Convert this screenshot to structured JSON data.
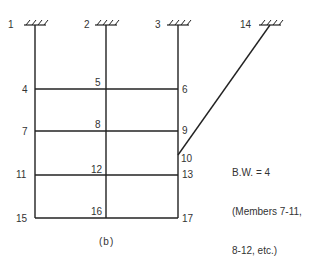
{
  "diagram": {
    "type": "frame-structure",
    "line_color": "#222222",
    "nodes": [
      {
        "id": "1",
        "label": "1",
        "x": 35,
        "y": 25,
        "support": "fixed",
        "label_x": 8,
        "label_y": 20
      },
      {
        "id": "2",
        "label": "2",
        "x": 106,
        "y": 25,
        "support": "fixed",
        "label_x": 84,
        "label_y": 20
      },
      {
        "id": "3",
        "label": "3",
        "x": 178,
        "y": 25,
        "support": "fixed",
        "label_x": 155,
        "label_y": 20
      },
      {
        "id": "4",
        "label": "4",
        "x": 35,
        "y": 89,
        "label_x": 22,
        "label_y": 85
      },
      {
        "id": "5",
        "label": "5",
        "x": 106,
        "y": 89,
        "label_x": 95,
        "label_y": 78
      },
      {
        "id": "6",
        "label": "6",
        "x": 178,
        "y": 89,
        "label_x": 182,
        "label_y": 85
      },
      {
        "id": "7",
        "label": "7",
        "x": 35,
        "y": 131,
        "label_x": 22,
        "label_y": 127
      },
      {
        "id": "8",
        "label": "8",
        "x": 106,
        "y": 131,
        "label_x": 95,
        "label_y": 120
      },
      {
        "id": "9",
        "label": "9",
        "x": 178,
        "y": 131,
        "label_x": 182,
        "label_y": 126
      },
      {
        "id": "10",
        "label": "10",
        "x": 178,
        "y": 155,
        "label_x": 181,
        "label_y": 154
      },
      {
        "id": "11",
        "label": "11",
        "x": 35,
        "y": 175,
        "label_x": 16,
        "label_y": 170
      },
      {
        "id": "12",
        "label": "12",
        "x": 106,
        "y": 175,
        "label_x": 91,
        "label_y": 165
      },
      {
        "id": "13",
        "label": "13",
        "x": 178,
        "y": 175,
        "label_x": 182,
        "label_y": 170
      },
      {
        "id": "14",
        "label": "14",
        "x": 270,
        "y": 25,
        "support": "fixed",
        "label_x": 240,
        "label_y": 20
      },
      {
        "id": "15",
        "label": "15",
        "x": 35,
        "y": 218,
        "label_x": 16,
        "label_y": 214
      },
      {
        "id": "16",
        "label": "16",
        "x": 106,
        "y": 218,
        "label_x": 91,
        "label_y": 207
      },
      {
        "id": "17",
        "label": "17",
        "x": 178,
        "y": 218,
        "label_x": 182,
        "label_y": 214
      }
    ],
    "members": [
      [
        "1",
        "4"
      ],
      [
        "4",
        "7"
      ],
      [
        "7",
        "11"
      ],
      [
        "11",
        "15"
      ],
      [
        "2",
        "5"
      ],
      [
        "5",
        "8"
      ],
      [
        "8",
        "12"
      ],
      [
        "12",
        "16"
      ],
      [
        "3",
        "6"
      ],
      [
        "6",
        "9"
      ],
      [
        "9",
        "10"
      ],
      [
        "10",
        "13"
      ],
      [
        "13",
        "17"
      ],
      [
        "4",
        "5"
      ],
      [
        "5",
        "6"
      ],
      [
        "7",
        "8"
      ],
      [
        "8",
        "9"
      ],
      [
        "11",
        "12"
      ],
      [
        "12",
        "13"
      ],
      [
        "15",
        "16"
      ],
      [
        "16",
        "17"
      ],
      [
        "10",
        "14"
      ]
    ],
    "annotation": {
      "lines": [
        "B.W. = 4",
        "(Members 7-11,",
        "8-12, etc.)"
      ],
      "x": 232,
      "y": 140
    },
    "caption": "(b)"
  }
}
